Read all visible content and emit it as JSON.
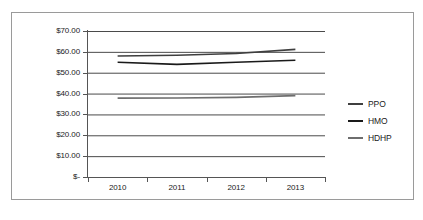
{
  "chart_data": {
    "type": "line",
    "title": "",
    "subtitle": "",
    "xlabel": "",
    "ylabel": "",
    "categories": [
      "2010",
      "2011",
      "2012",
      "2013"
    ],
    "ylim": [
      0,
      70
    ],
    "ytick_values": [
      0,
      10,
      20,
      30,
      40,
      50,
      60,
      70
    ],
    "ytick_labels": [
      "$-",
      "$10.00",
      "$20.00",
      "$30.00",
      "$40.00",
      "$50.00",
      "$60.00",
      "$70.00"
    ],
    "grid": "horizontal",
    "legend_position": "right",
    "series": [
      {
        "name": "PPO",
        "color": "#3f3f3f",
        "values": [
          58.0,
          58.4,
          59.2,
          61.2
        ]
      },
      {
        "name": "HMO",
        "color": "#1a1a1a",
        "values": [
          55.0,
          54.0,
          55.0,
          56.0
        ]
      },
      {
        "name": "HDHP",
        "color": "#6e6e6e",
        "values": [
          37.8,
          37.9,
          38.2,
          39.0
        ]
      }
    ],
    "annotations": []
  },
  "legend": {
    "items": [
      {
        "label": "PPO"
      },
      {
        "label": "HMO"
      },
      {
        "label": "HDHP"
      }
    ]
  },
  "colors": {
    "gridline": "#4a4a4a",
    "axis": "#555555",
    "border": "#9a9a9a",
    "background": "#ffffff",
    "text": "#1a1a1a"
  }
}
